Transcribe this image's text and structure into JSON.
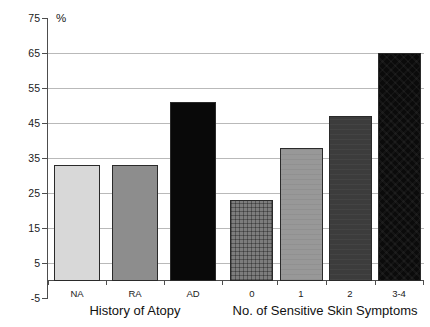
{
  "chart_data": {
    "type": "bar",
    "title": "",
    "subtitle": "",
    "xlabel": "",
    "ylabel": "%",
    "ylim": [
      -5,
      75
    ],
    "y_ticks": [
      75,
      65,
      55,
      45,
      35,
      25,
      15,
      5,
      -5
    ],
    "y_tick_labels": [
      "75",
      "65",
      "55",
      "45",
      "35",
      "25",
      "15",
      "5",
      "-5"
    ],
    "gridlines": [
      65,
      55,
      45,
      35,
      25,
      15,
      5
    ],
    "grid": true,
    "legend": "none",
    "groups": [
      {
        "name": "History of Atopy",
        "categories": [
          "NA",
          "RA",
          "AD"
        ],
        "values": [
          33,
          33,
          51
        ],
        "fills": [
          "light-gray",
          "mid-gray",
          "black"
        ]
      },
      {
        "name": "No. of Sensitive Skin Symptoms",
        "categories": [
          "0",
          "1",
          "2",
          "3-4"
        ],
        "values": [
          23,
          38,
          47,
          65
        ],
        "fills": [
          "crosshatch",
          "gray-1",
          "gray-2",
          "black-tex"
        ]
      }
    ],
    "categories": [
      "NA",
      "RA",
      "AD",
      "0",
      "1",
      "2",
      "3-4"
    ],
    "values": [
      33,
      33,
      51,
      23,
      38,
      47,
      65
    ],
    "colors": {
      "light_gray": "#d8d8d8",
      "mid_gray": "#8d8d8d",
      "black": "#090909",
      "crosshatch": "#7d7d7d",
      "gray_1": "#989898",
      "gray_2": "#3c3c3c",
      "black_tex": "#0b0b0b",
      "gridline": "#b9b9b9",
      "axis": "#4d4d4d",
      "text": "#1a1a1a"
    }
  },
  "axis": {
    "percent_symbol": "%",
    "ticks": [
      {
        "label": "75"
      },
      {
        "label": "65"
      },
      {
        "label": "55"
      },
      {
        "label": "45"
      },
      {
        "label": "35"
      },
      {
        "label": "25"
      },
      {
        "label": "15"
      },
      {
        "label": "5"
      },
      {
        "label": "-5"
      }
    ]
  },
  "bars": [
    {
      "label": "NA",
      "value": 33
    },
    {
      "label": "RA",
      "value": 33
    },
    {
      "label": "AD",
      "value": 51
    },
    {
      "label": "0",
      "value": 23
    },
    {
      "label": "1",
      "value": 38
    },
    {
      "label": "2",
      "value": 47
    },
    {
      "label": "3-4",
      "value": 65
    }
  ],
  "group_titles": {
    "left": "History of Atopy",
    "right": "No. of Sensitive Skin Symptoms"
  }
}
